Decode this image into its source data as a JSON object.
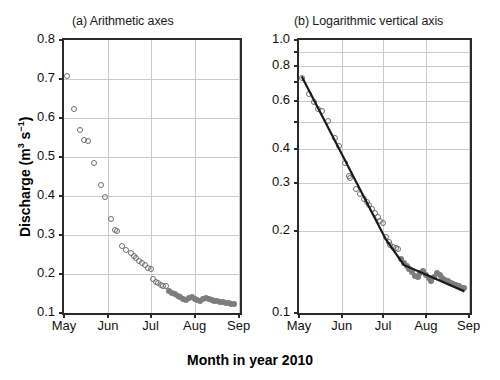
{
  "figure": {
    "xlabel": "Month in year 2010",
    "ylabel_main": "Discharge (m",
    "ylabel_sup1": "3",
    "ylabel_mid": " s",
    "ylabel_sup2": "−1",
    "ylabel_end": ")",
    "ylabel_plain": "Discharge (m3 s-1)",
    "colors": {
      "open_marker_stroke": "#6e6e6e",
      "filled_marker": "#7d7d7d",
      "fit_line": "#1a1a1a",
      "grid": "#c9c9c9",
      "frame": "#2b2b2b"
    }
  },
  "chart_data": [
    {
      "type": "scatter",
      "title": "(a) Arithmetic axes",
      "xlabel": "Month in year 2010",
      "ylabel": "Discharge (m3 s-1)",
      "yscale": "linear",
      "ylim": [
        0.1,
        0.8
      ],
      "yticks": [
        0.1,
        0.2,
        0.3,
        0.4,
        0.5,
        0.6,
        0.7,
        0.8
      ],
      "ytick_labels": [
        "0.1",
        "0.2",
        "0.3",
        "0.4",
        "0.5",
        "0.6",
        "0.7",
        "0.8"
      ],
      "xlim_days": [
        0,
        124
      ],
      "xticks_days": [
        0,
        31,
        61,
        92,
        123
      ],
      "xtick_labels": [
        "May",
        "Jun",
        "Jul",
        "Aug",
        "Sep"
      ],
      "grid": true,
      "legend": "none",
      "series": [
        {
          "name": "Recession discharge (open circles)",
          "marker": "open-circle",
          "x_days": [
            2,
            7,
            11,
            14,
            17,
            21,
            26,
            29,
            33,
            36,
            37,
            41,
            44,
            47,
            49,
            51,
            53,
            55,
            57,
            59,
            61,
            63,
            65,
            66,
            68,
            70,
            72
          ],
          "values": [
            0.707,
            0.622,
            0.568,
            0.543,
            0.541,
            0.484,
            0.428,
            0.397,
            0.342,
            0.313,
            0.31,
            0.273,
            0.262,
            0.254,
            0.247,
            0.24,
            0.234,
            0.229,
            0.222,
            0.215,
            0.212,
            0.186,
            0.18,
            0.176,
            0.172,
            0.17,
            0.169
          ]
        },
        {
          "name": "Recession discharge (filled circles)",
          "marker": "filled-circle",
          "x_days": [
            74,
            76,
            78,
            80,
            82,
            84,
            86,
            88,
            90,
            92,
            94,
            96,
            98,
            100,
            102,
            104,
            106,
            108,
            110,
            112,
            114,
            116,
            118,
            120
          ],
          "values": [
            0.157,
            0.152,
            0.148,
            0.144,
            0.14,
            0.136,
            0.134,
            0.139,
            0.141,
            0.137,
            0.133,
            0.13,
            0.135,
            0.139,
            0.137,
            0.133,
            0.131,
            0.13,
            0.128,
            0.127,
            0.126,
            0.125,
            0.123,
            0.122
          ]
        }
      ]
    },
    {
      "type": "scatter",
      "title": "(b) Logarithmic vertical axis",
      "xlabel": "Month in year 2010",
      "ylabel": "Discharge (m3 s-1)",
      "yscale": "log",
      "ylim": [
        0.1,
        1.0
      ],
      "yticks": [
        0.1,
        0.2,
        0.3,
        0.4,
        0.5,
        0.6,
        0.7,
        0.8,
        0.9,
        1.0
      ],
      "ytick_labels": [
        "0.1",
        "0.2",
        "0.3",
        "0.4",
        "",
        "0.6",
        "",
        "0.8",
        "",
        "1.0"
      ],
      "xlim_days": [
        0,
        124
      ],
      "xticks_days": [
        0,
        31,
        61,
        92,
        123
      ],
      "xtick_labels": [
        "May",
        "Jun",
        "Jul",
        "Aug",
        "Sep"
      ],
      "grid": true,
      "legend": "none",
      "series": [
        {
          "name": "Recession discharge (open circles)",
          "marker": "open-circle",
          "x_days": [
            2,
            7,
            11,
            14,
            17,
            21,
            26,
            29,
            33,
            36,
            37,
            41,
            44,
            47,
            49,
            51,
            53,
            55,
            57,
            59,
            61,
            63,
            65,
            66,
            68,
            70,
            72
          ],
          "values": [
            0.725,
            0.632,
            0.592,
            0.56,
            0.551,
            0.505,
            0.437,
            0.408,
            0.354,
            0.318,
            0.312,
            0.285,
            0.273,
            0.262,
            0.255,
            0.248,
            0.24,
            0.233,
            0.225,
            0.218,
            0.214,
            0.19,
            0.182,
            0.178,
            0.175,
            0.173,
            0.171
          ]
        },
        {
          "name": "Recession discharge (filled circles)",
          "marker": "filled-circle",
          "x_days": [
            74,
            76,
            78,
            80,
            82,
            84,
            86,
            88,
            90,
            92,
            94,
            96,
            98,
            100,
            102,
            104,
            106,
            108,
            110,
            112,
            114,
            116,
            118,
            120
          ],
          "values": [
            0.158,
            0.153,
            0.149,
            0.145,
            0.141,
            0.137,
            0.135,
            0.14,
            0.142,
            0.138,
            0.134,
            0.131,
            0.136,
            0.14,
            0.138,
            0.134,
            0.132,
            0.131,
            0.129,
            0.128,
            0.127,
            0.126,
            0.124,
            0.123
          ]
        },
        {
          "name": "Fitted piecewise log-linear recession",
          "type": "line",
          "x_days": [
            2,
            63,
            76,
            120
          ],
          "values": [
            0.735,
            0.186,
            0.15,
            0.12
          ]
        }
      ]
    }
  ]
}
